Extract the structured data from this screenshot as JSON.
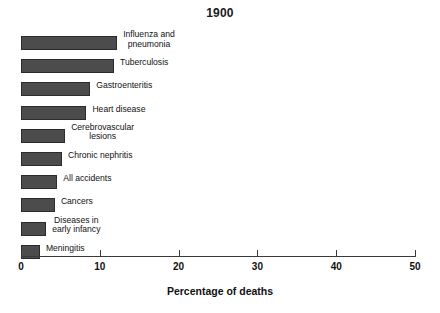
{
  "chart_data": {
    "type": "bar",
    "orientation": "horizontal",
    "title": "1900",
    "xlabel": "Percentage of deaths",
    "ylabel": "",
    "xlim": [
      0,
      50
    ],
    "xticks": [
      0,
      10,
      20,
      30,
      40,
      50
    ],
    "xtick_labels": [
      "0",
      "10",
      "20",
      "30",
      "40",
      "50"
    ],
    "grid": false,
    "legend": null,
    "bar_color": "#4c4c4c",
    "bar_edge_color": "#2b2b2b",
    "categories": [
      "Influenza and\npneumonia",
      "Tuberculosis",
      "Gastroenteritis",
      "Heart disease",
      "Cerebrovascular\nlesions",
      "Chronic nephritis",
      "All accidents",
      "Cancers",
      "Diseases in\nearly infancy",
      "Meningitis"
    ],
    "values": [
      12.2,
      11.8,
      8.8,
      8.3,
      5.6,
      5.2,
      4.6,
      4.3,
      3.2,
      2.4
    ],
    "bars": [
      {
        "label_line1": "Influenza and",
        "label_line2": "pneumonia",
        "value": 12.2,
        "two_line": true
      },
      {
        "label_line1": "Tuberculosis",
        "label_line2": "",
        "value": 11.8,
        "two_line": false
      },
      {
        "label_line1": "Gastroenteritis",
        "label_line2": "",
        "value": 8.8,
        "two_line": false
      },
      {
        "label_line1": "Heart disease",
        "label_line2": "",
        "value": 8.3,
        "two_line": false
      },
      {
        "label_line1": "Cerebrovascular",
        "label_line2": "lesions",
        "value": 5.6,
        "two_line": true
      },
      {
        "label_line1": "Chronic nephritis",
        "label_line2": "",
        "value": 5.2,
        "two_line": false
      },
      {
        "label_line1": "All accidents",
        "label_line2": "",
        "value": 4.6,
        "two_line": false
      },
      {
        "label_line1": "Cancers",
        "label_line2": "",
        "value": 4.3,
        "two_line": false
      },
      {
        "label_line1": "Diseases in",
        "label_line2": "early infancy",
        "value": 3.2,
        "two_line": true
      },
      {
        "label_line1": "Meningitis",
        "label_line2": "",
        "value": 2.4,
        "two_line": false
      }
    ]
  },
  "axis": {
    "origin_x_px": 21,
    "px_per_unit": 7.88,
    "baseline_y_px": 256
  },
  "layout": {
    "first_row_y_px": 36,
    "row_step_px": 23.2,
    "bar_height_px": 14,
    "label_gap_px": 6
  }
}
